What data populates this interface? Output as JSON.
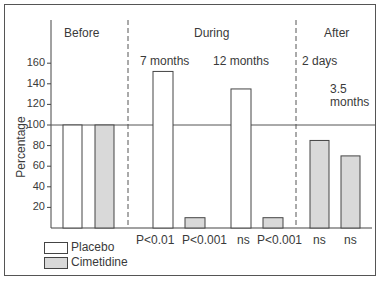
{
  "chart_data": {
    "type": "bar",
    "title": "",
    "xlabel": "",
    "ylabel": "Percentage",
    "ylim": [
      0,
      180
    ],
    "yticks": [
      20,
      40,
      60,
      80,
      100,
      120,
      140,
      160
    ],
    "reference_line": 100,
    "grid": false,
    "legend_position": "bottom-left",
    "sections": [
      {
        "label": "Before"
      },
      {
        "label": "During"
      },
      {
        "label": "After"
      }
    ],
    "groups": [
      {
        "section": "Before",
        "label": "",
        "placebo": 100,
        "cimetidine": 100,
        "placebo_p": "",
        "cimetidine_p": ""
      },
      {
        "section": "During",
        "label": "7 months",
        "placebo": 152,
        "cimetidine": 10,
        "placebo_p": "P<0.01",
        "cimetidine_p": "P<0.001"
      },
      {
        "section": "During",
        "label": "12 months",
        "placebo": 135,
        "cimetidine": 10,
        "placebo_p": "ns",
        "cimetidine_p": "P<0.001"
      },
      {
        "section": "After",
        "label": "2 days",
        "placebo": null,
        "cimetidine": 85,
        "placebo_p": "",
        "cimetidine_p": "ns"
      },
      {
        "section": "After",
        "label": "3.5 months",
        "placebo": null,
        "cimetidine": 70,
        "placebo_p": "",
        "cimetidine_p": "ns"
      }
    ],
    "series": [
      {
        "name": "Placebo",
        "values": [
          100,
          152,
          135,
          null,
          null
        ],
        "color": "#ffffff"
      },
      {
        "name": "Cimetidine",
        "values": [
          100,
          10,
          10,
          85,
          70
        ],
        "color": "#d9d9d9"
      }
    ]
  },
  "labels": {
    "before": "Before",
    "during": "During",
    "after": "After",
    "m7": "7 months",
    "m12": "12 months",
    "d2": "2 days",
    "m35a": "3.5",
    "m35b": "months",
    "p1": "P<0.01",
    "p2": "P<0.001",
    "p3": "ns",
    "p4": "P<0.001",
    "p5": "ns",
    "p6": "ns",
    "ylabel": "Percentage",
    "legend_placebo": "Placebo",
    "legend_cimetidine": "Cimetidine"
  },
  "ticks": [
    "160",
    "140",
    "120",
    "100",
    "80",
    "60",
    "40",
    "20"
  ]
}
